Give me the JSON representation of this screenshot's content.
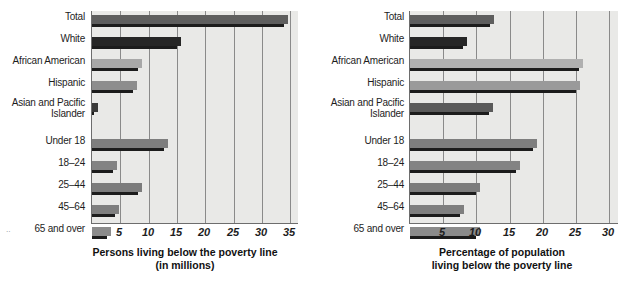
{
  "chart_data": [
    {
      "id": "persons",
      "type": "bar",
      "orientation": "horizontal",
      "title": "",
      "xlabel": "Persons living below the poverty line (in millions)",
      "caption_line1": "Persons living below the poverty line",
      "caption_line2": "(in millions)",
      "ylabel": "",
      "xlim": [
        0,
        36.5
      ],
      "xticks": [
        5,
        10,
        15,
        20,
        25,
        30,
        35
      ],
      "xtick_labels": [
        "5",
        "10",
        "15",
        "20",
        "25",
        "30",
        "35"
      ],
      "grid": true,
      "legend": "none",
      "categories": [
        "Total",
        "White",
        "African American",
        "Hispanic",
        "Asian and Pacific Islander",
        "Under 18",
        "18–24",
        "25–44",
        "45–64",
        "65 and over"
      ],
      "values": [
        34.5,
        15.7,
        8.9,
        8.0,
        1.0,
        13.4,
        4.4,
        8.8,
        4.7,
        3.4
      ],
      "bar_colors": [
        "#5e5e5e",
        "#262626",
        "#a8a8a8",
        "#8d8d8d",
        "#3a3a3a",
        "#7e7e7e",
        "#838383",
        "#7c7c7c",
        "#7f7f7f",
        "#8b8b8b"
      ]
    },
    {
      "id": "percentage",
      "type": "bar",
      "orientation": "horizontal",
      "title": "",
      "xlabel": "Percentage of population living below the poverty line",
      "caption_line1": "Percentage of population",
      "caption_line2": "living below the poverty line",
      "ylabel": "",
      "xlim": [
        0,
        31.5
      ],
      "xticks": [
        5,
        10,
        15,
        20,
        25,
        30
      ],
      "xtick_labels": [
        "5",
        "10",
        "15",
        "20",
        "25",
        "30"
      ],
      "grid": true,
      "legend": "none",
      "categories": [
        "Total",
        "White",
        "African American",
        "Hispanic",
        "Asian and Pacific Islander",
        "Under 18",
        "18–24",
        "25–44",
        "45–64",
        "65 and over"
      ],
      "values": [
        12.7,
        8.6,
        26.1,
        25.6,
        12.5,
        19.2,
        16.6,
        10.5,
        8.2,
        10.5
      ],
      "bar_colors": [
        "#5e5e5e",
        "#262626",
        "#b0b0b0",
        "#9a9a9a",
        "#5a5a5a",
        "#7e7e7e",
        "#838383",
        "#7c7c7c",
        "#7f7f7f",
        "#8b8b8b"
      ]
    }
  ],
  "colors": {
    "plot_background": "#e9e9e7",
    "gridline": "#8a8a8a",
    "axis": "#6d6d6d",
    "shadow": "#1c1c1c",
    "text": "#1d1d1d",
    "page_background": "#ffffff"
  },
  "artifacts": {
    "speck_left": "··",
    "speck_mid": "·"
  }
}
